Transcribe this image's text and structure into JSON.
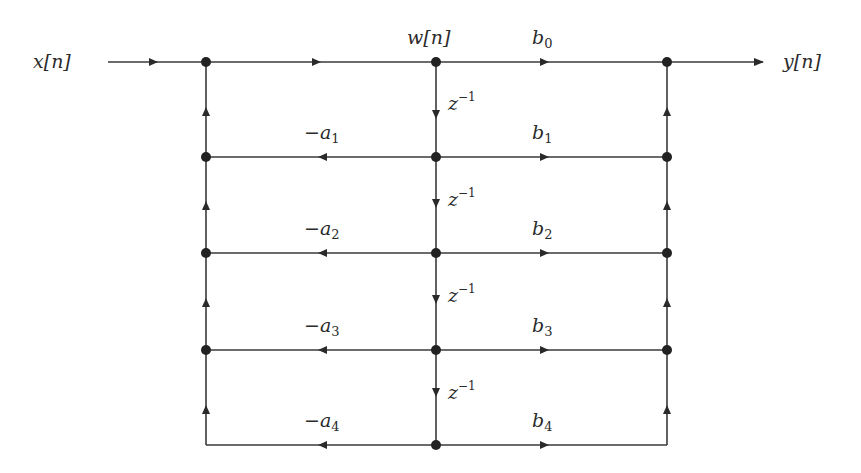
{
  "diagram": {
    "colors": {
      "line": "#3a3a3a",
      "node": "#222222",
      "text": "#2b2b2b"
    },
    "input_label": "x[n]",
    "output_label": "y[n]",
    "state_label": "w[n]",
    "delay_labels": [
      "z",
      "z",
      "z",
      "z"
    ],
    "delay_exponent": "−1",
    "feedback": [
      {
        "sign": "−",
        "sym": "a",
        "idx": "1"
      },
      {
        "sign": "−",
        "sym": "a",
        "idx": "2"
      },
      {
        "sign": "−",
        "sym": "a",
        "idx": "3"
      },
      {
        "sign": "−",
        "sym": "a",
        "idx": "4"
      }
    ],
    "feedforward": [
      {
        "sym": "b",
        "idx": "0"
      },
      {
        "sym": "b",
        "idx": "1"
      },
      {
        "sym": "b",
        "idx": "2"
      },
      {
        "sym": "b",
        "idx": "3"
      },
      {
        "sym": "b",
        "idx": "4"
      }
    ],
    "nodes": {
      "columns_x": [
        206,
        436,
        667
      ],
      "rows_y": [
        62,
        157,
        253,
        350,
        445
      ]
    }
  }
}
